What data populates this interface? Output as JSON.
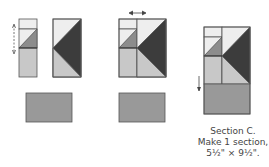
{
  "diagram": {
    "colors": {
      "light": "#eeeeee",
      "medium_light": "#c8c8c8",
      "medium": "#8c8c8c",
      "dark": "#3c3c3c",
      "rect": "#999999",
      "outline": "#555555"
    },
    "steps": [
      {
        "name": "step-1",
        "arrow": "vertical-double"
      },
      {
        "name": "step-2",
        "arrow": "horizontal-double"
      },
      {
        "name": "step-3",
        "arrow": "down"
      }
    ]
  },
  "caption": {
    "line1": "Section C.",
    "line2": "Make 1 section,",
    "line3": "5½\" × 9½\"."
  }
}
